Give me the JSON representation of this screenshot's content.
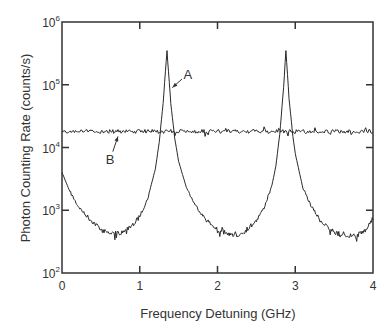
{
  "chart_data": {
    "type": "line",
    "title": "",
    "xlabel": "Frequency Detuning (GHz)",
    "ylabel": "Photon Counting Rate (counts/s)",
    "xlim": [
      0,
      4
    ],
    "ylim": [
      100,
      1000000
    ],
    "yscale": "log",
    "grid": false,
    "x_ticks": [
      0,
      1,
      2,
      3,
      4
    ],
    "x_tick_labels": [
      "0",
      "1",
      "2",
      "3",
      "4"
    ],
    "y_ticks": [
      100,
      1000,
      10000,
      100000,
      1000000
    ],
    "y_tick_labels": [
      {
        "base": "10",
        "exp": "2"
      },
      {
        "base": "10",
        "exp": "3"
      },
      {
        "base": "10",
        "exp": "4"
      },
      {
        "base": "10",
        "exp": "5"
      },
      {
        "base": "10",
        "exp": "6"
      }
    ],
    "series": [
      {
        "name": "A",
        "description": "Two Lorentzian-like peaks on a low background",
        "x": [
          0.0,
          0.1,
          0.2,
          0.3,
          0.4,
          0.5,
          0.6,
          0.7,
          0.8,
          0.9,
          1.0,
          1.1,
          1.2,
          1.25,
          1.3,
          1.35,
          1.4,
          1.45,
          1.5,
          1.6,
          1.7,
          1.8,
          1.9,
          2.0,
          2.1,
          2.2,
          2.3,
          2.4,
          2.5,
          2.6,
          2.7,
          2.75,
          2.8,
          2.85,
          2.88,
          2.92,
          2.97,
          3.0,
          3.1,
          3.2,
          3.3,
          3.4,
          3.5,
          3.6,
          3.7,
          3.8,
          3.9,
          4.0
        ],
        "values": [
          4000,
          2000,
          1200,
          850,
          650,
          500,
          430,
          430,
          450,
          550,
          800,
          1500,
          4500,
          12000,
          50000,
          350000,
          50000,
          14000,
          6000,
          2300,
          1300,
          850,
          620,
          500,
          440,
          390,
          420,
          520,
          700,
          1100,
          2500,
          5000,
          16000,
          90000,
          350000,
          60000,
          15000,
          8000,
          2200,
          1200,
          750,
          550,
          450,
          400,
          390,
          400,
          480,
          750
        ]
      },
      {
        "name": "B",
        "description": "Flat noisy background",
        "x": [
          0,
          4
        ],
        "values": [
          18000,
          18000
        ]
      }
    ],
    "annotations": [
      {
        "label": "A",
        "x": 1.62,
        "y": 150000,
        "arrow_to": {
          "x": 1.42,
          "y": 90000
        }
      },
      {
        "label": "B",
        "x": 0.62,
        "y": 6500,
        "arrow_to": {
          "x": 0.72,
          "y": 15000
        }
      }
    ],
    "legend": null
  },
  "colors": {
    "line": "#2a2a2a",
    "axis": "#333333",
    "background": "#ffffff"
  }
}
